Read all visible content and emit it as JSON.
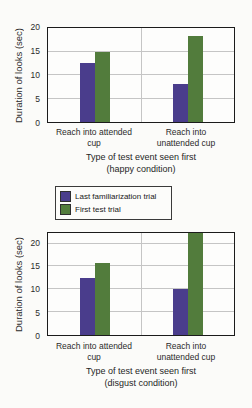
{
  "figure": {
    "legend": {
      "items": [
        {
          "label": "Last familiarization trial",
          "color": "#4a3d8c"
        },
        {
          "label": "First test trial",
          "color": "#527c3c"
        }
      ]
    }
  },
  "chart_data": [
    {
      "type": "bar",
      "title": "",
      "ylabel": "Duration of looks (sec)",
      "xlabel": "Type of test event seen first",
      "condition": "(happy condition)",
      "categories": [
        "Reach into attended cup",
        "Reach into unattended cup"
      ],
      "series": [
        {
          "name": "Last familiarization trial",
          "color": "#4a3d8c",
          "values": [
            12.5,
            8
          ]
        },
        {
          "name": "First test trial",
          "color": "#527c3c",
          "values": [
            15,
            18.3
          ]
        }
      ],
      "ylim": [
        0,
        20
      ],
      "yticks": [
        0,
        5,
        10,
        15,
        20
      ],
      "grid": "horizontal gridlines with vertical divider between category groups",
      "legend_position": "below-chart"
    },
    {
      "type": "bar",
      "title": "",
      "ylabel": "Duration of looks (sec)",
      "xlabel": "Type of test event seen first",
      "condition": "(disgust condition)",
      "categories": [
        "Reach into attended cup",
        "Reach into unattended cup"
      ],
      "series": [
        {
          "name": "Last familiarization trial",
          "color": "#4a3d8c",
          "values": [
            12.5,
            10
          ]
        },
        {
          "name": "First test trial",
          "color": "#527c3c",
          "values": [
            15.8,
            22.3
          ]
        }
      ],
      "ylim": [
        0,
        22.3
      ],
      "yticks": [
        0,
        5,
        10,
        15,
        20
      ],
      "grid": "horizontal gridlines with vertical divider between category groups"
    }
  ]
}
